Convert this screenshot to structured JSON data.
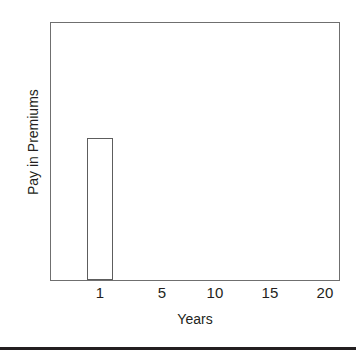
{
  "chart_data": {
    "type": "bar",
    "title": "",
    "subtitle": "",
    "xlabel": "Years",
    "ylabel": "Pay in Premiums",
    "categories": [
      "1",
      "5",
      "10",
      "15",
      "20"
    ],
    "tick_labels": [
      {
        "label": "1",
        "value": 1,
        "x_px": 100
      },
      {
        "label": "5",
        "value": 5,
        "x_px": 162
      },
      {
        "label": "10",
        "value": 10,
        "x_px": 215
      },
      {
        "label": "15",
        "value": 15,
        "x_px": 270
      },
      {
        "label": "20",
        "value": 20,
        "x_px": 325
      }
    ],
    "bars": [
      {
        "category": "1",
        "value": 55,
        "left_pct": 12.4,
        "width_pct": 9.3,
        "height_pct": 55.2,
        "fill": "#ffffff",
        "stroke": "#5d5d5d"
      }
    ],
    "xlim": [
      0,
      21
    ],
    "ylim": [
      0,
      100
    ],
    "grid": false,
    "legend": null,
    "legend_position": "none",
    "annotations": [],
    "axis_color": "#6f6f6f",
    "text_color": "#231f20",
    "plot_background": "#ffffff"
  },
  "figure": {
    "background": "#ffffff",
    "bottom_rule_color": "#231f20"
  }
}
